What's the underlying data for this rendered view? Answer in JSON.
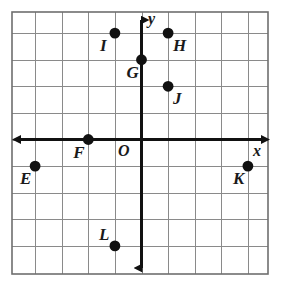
{
  "figure": {
    "type": "coordinate-plane",
    "background_color": "#ffffff",
    "grid_color": "#8a8a8a",
    "border_color": "#6e6e6e",
    "axis_color": "#111111",
    "point_color": "#111111",
    "label_color": "#1a1a1a"
  },
  "axes": {
    "x_label": "x",
    "y_label": "y",
    "origin_label": "O",
    "x_range": [
      -5,
      5
    ],
    "y_range": [
      -5,
      5
    ],
    "grid": true,
    "ticks_shown": false,
    "arrowheads": [
      "left",
      "right",
      "up",
      "down"
    ]
  },
  "chart_data": {
    "type": "scatter",
    "title": "",
    "xlabel": "x",
    "ylabel": "y",
    "xlim": [
      -5,
      5
    ],
    "ylim": [
      -5,
      5
    ],
    "grid": true,
    "legend": "none",
    "points": [
      {
        "label": "E",
        "x": -4,
        "y": -1,
        "label_pos": "below-left"
      },
      {
        "label": "F",
        "x": -2,
        "y": 0,
        "label_pos": "below-left"
      },
      {
        "label": "G",
        "x": 0,
        "y": 3,
        "label_pos": "below-left"
      },
      {
        "label": "H",
        "x": 1,
        "y": 4,
        "label_pos": "below-right"
      },
      {
        "label": "I",
        "x": -1,
        "y": 4,
        "label_pos": "below-left"
      },
      {
        "label": "J",
        "x": 1,
        "y": 2,
        "label_pos": "below-right"
      },
      {
        "label": "K",
        "x": 4,
        "y": -1,
        "label_pos": "below-left"
      },
      {
        "label": "L",
        "x": -1,
        "y": -4,
        "label_pos": "above-left"
      }
    ]
  },
  "labels": {
    "E": "E",
    "F": "F",
    "G": "G",
    "H": "H",
    "I": "I",
    "J": "J",
    "K": "K",
    "L": "L",
    "x_axis": "x",
    "y_axis": "y",
    "origin": "O"
  }
}
